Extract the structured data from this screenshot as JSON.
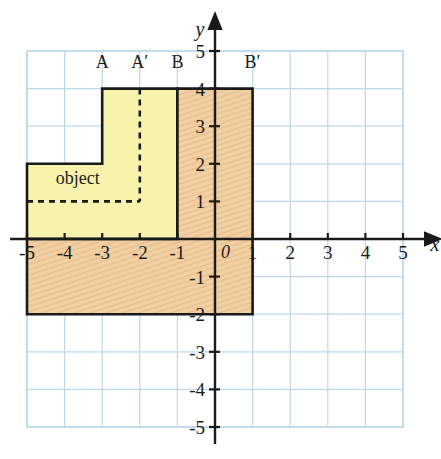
{
  "figure": {
    "background": "#ffffff",
    "grid_color": "#bcd8ee",
    "grid_border_color": "#c2dcef",
    "axis_color": "#1a1a1a",
    "object_fill": "#f8f3ac",
    "image_fill": "#f2cfa2",
    "outline_color": "#1a1a1a"
  },
  "axes": {
    "x_name": "x",
    "y_name": "y",
    "origin_label": "0",
    "x_ticks": [
      "-5",
      "-4",
      "-3",
      "-2",
      "-1",
      "1",
      "2",
      "3",
      "4",
      "5"
    ],
    "y_ticks": [
      "5",
      "4",
      "3",
      "2",
      "1",
      "-1",
      "-2",
      "-3",
      "-4",
      "-5"
    ],
    "x_range": [
      -5.5,
      5.5
    ],
    "y_range": [
      -5.5,
      5.5
    ],
    "unit_px": 37.6,
    "origin_px": [
      215,
      239
    ]
  },
  "labels": {
    "object": "object",
    "A": "A",
    "A_prime": "A′",
    "B": "B",
    "B_prime": "B′"
  },
  "chart_data": {
    "type": "diagram",
    "xlabel": "x",
    "ylabel": "y",
    "xlim": [
      -5.5,
      5.5
    ],
    "ylim": [
      -5.5,
      5.5
    ],
    "grid": true,
    "shapes": [
      {
        "name": "object",
        "label": "object",
        "fill": "#f8f3ac",
        "vertices": [
          [
            -5,
            0
          ],
          [
            -5,
            2
          ],
          [
            -3,
            2
          ],
          [
            -3,
            4
          ],
          [
            -1,
            4
          ],
          [
            -1,
            0
          ]
        ]
      },
      {
        "name": "image",
        "label": "",
        "fill": "#f2cfa2",
        "hatched": true,
        "vertices": [
          [
            -5,
            -2
          ],
          [
            -5,
            0
          ],
          [
            -1,
            0
          ],
          [
            -1,
            4
          ],
          [
            1,
            4
          ],
          [
            1,
            -2
          ]
        ]
      }
    ],
    "dashed_lines": [
      {
        "name": "mirror-vertical",
        "from": [
          -2,
          4
        ],
        "to": [
          -2,
          1
        ]
      },
      {
        "name": "mirror-horizontal",
        "from": [
          -5,
          1
        ],
        "to": [
          -2,
          1
        ]
      }
    ],
    "annotations": [
      {
        "text": "A",
        "x": -3,
        "y": 4.55
      },
      {
        "text": "A′",
        "x": -2,
        "y": 4.55
      },
      {
        "text": "B",
        "x": -1,
        "y": 4.55
      },
      {
        "text": "B′",
        "x": 1,
        "y": 4.55
      }
    ]
  }
}
